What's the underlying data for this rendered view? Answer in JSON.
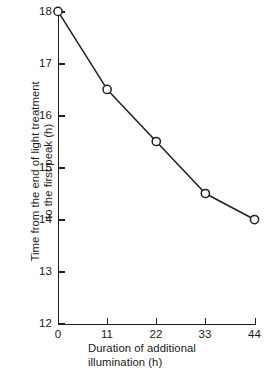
{
  "chart_data": {
    "type": "line",
    "title": "",
    "subtitle": "",
    "xlabel": "Duration of additional\nillumination (h)",
    "ylabel": "Time from the end of light treatment\nto the first peak (h)",
    "x": [
      0,
      11,
      22,
      33,
      44
    ],
    "values": [
      18.0,
      16.5,
      15.5,
      14.5,
      14.0
    ],
    "series": [
      {
        "name": "Time to first peak",
        "x": [
          0,
          11,
          22,
          33,
          44
        ],
        "values": [
          18.0,
          16.5,
          15.5,
          14.5,
          14.0
        ]
      }
    ],
    "xlim": [
      0,
      44
    ],
    "ylim": [
      12,
      18
    ],
    "xticks": [
      0,
      11,
      22,
      33,
      44
    ],
    "yticks": [
      12,
      13,
      14,
      15,
      16,
      17,
      18
    ],
    "xtick_labels": [
      "0",
      "11",
      "22",
      "33",
      "44"
    ],
    "ytick_labels": [
      "12",
      "13",
      "14",
      "15",
      "16",
      "17",
      "18"
    ],
    "grid": false,
    "legend": false,
    "legend_position": "none",
    "marker": "open-circle",
    "line_color": "#1f1f1f",
    "marker_fill_color": "#ffffff",
    "marker_edge_color": "#1f1f1f",
    "background_color": "#ffffff",
    "annotations": []
  }
}
